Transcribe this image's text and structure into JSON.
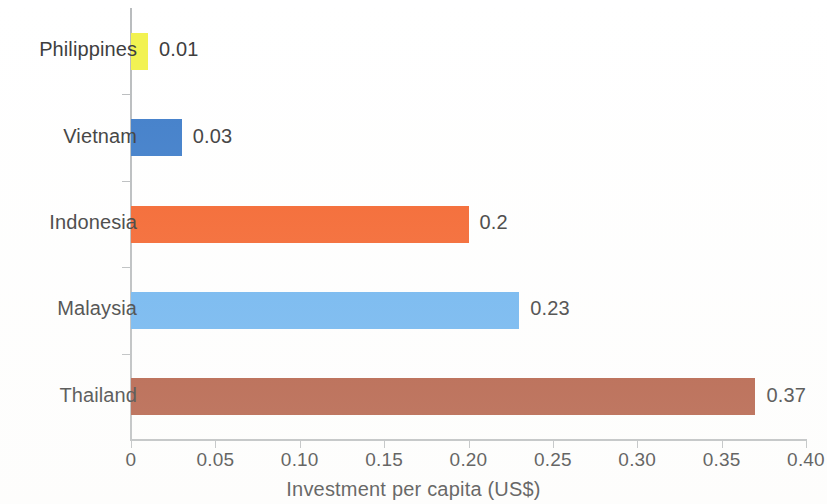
{
  "chart_data": {
    "type": "bar",
    "orientation": "horizontal",
    "title": "",
    "xlabel": "Investment per capita (US$)",
    "ylabel": "",
    "xlim": [
      0,
      0.4
    ],
    "grid": false,
    "legend": "none",
    "categories": [
      "Philippines",
      "Vietnam",
      "Indonesia",
      "Malaysia",
      "Thailand"
    ],
    "values": [
      0.01,
      0.03,
      0.2,
      0.23,
      0.37
    ],
    "value_labels": [
      "0.01",
      "0.03",
      "0.2",
      "0.23",
      "0.37"
    ],
    "bar_colors": [
      "#f2f24e",
      "#3d7cc9",
      "#f4622a",
      "#6bb3f0",
      "#b0563c"
    ],
    "xticks": [
      0,
      0.05,
      0.1,
      0.15,
      0.2,
      0.25,
      0.3,
      0.35,
      0.4
    ],
    "xtick_labels": [
      "0",
      "0.05",
      "0.10",
      "0.15",
      "0.20",
      "0.25",
      "0.30",
      "0.35",
      "0.40"
    ],
    "axis_color": "#b9bcbe",
    "text_color": "#3a3a3a",
    "background": "#ffffff"
  },
  "axis": {
    "x_title": "Investment per capita (US$)"
  },
  "bars": [
    {
      "category": "Philippines",
      "value": 0.01,
      "label": "0.01",
      "color": "#f2f24e"
    },
    {
      "category": "Vietnam",
      "value": 0.03,
      "label": "0.03",
      "color": "#3d7cc9"
    },
    {
      "category": "Indonesia",
      "value": 0.2,
      "label": "0.2",
      "color": "#f4622a"
    },
    {
      "category": "Malaysia",
      "value": 0.23,
      "label": "0.23",
      "color": "#6bb3f0"
    },
    {
      "category": "Thailand",
      "value": 0.37,
      "label": "0.37",
      "color": "#b0563c"
    }
  ],
  "xticks": [
    {
      "value": 0,
      "label": "0"
    },
    {
      "value": 0.05,
      "label": "0.05"
    },
    {
      "value": 0.1,
      "label": "0.10"
    },
    {
      "value": 0.15,
      "label": "0.15"
    },
    {
      "value": 0.2,
      "label": "0.20"
    },
    {
      "value": 0.25,
      "label": "0.25"
    },
    {
      "value": 0.3,
      "label": "0.30"
    },
    {
      "value": 0.35,
      "label": "0.35"
    },
    {
      "value": 0.4,
      "label": "0.40"
    }
  ]
}
